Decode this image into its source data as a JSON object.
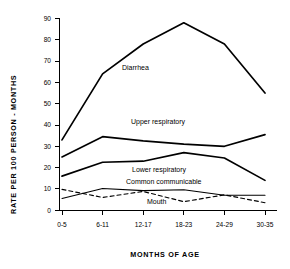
{
  "chart_data": {
    "type": "line",
    "title": "",
    "xlabel": "MONTHS OF AGE",
    "ylabel": "RATE PER 100 PERSON - MONTHS",
    "categories": [
      "0-5",
      "6-11",
      "12-17",
      "18-23",
      "24-29",
      "30-35"
    ],
    "ylim": [
      0,
      90
    ],
    "yticks": [
      0,
      10,
      20,
      30,
      40,
      50,
      60,
      70,
      80,
      90
    ],
    "grid": false,
    "legend_position": "inline-annotations",
    "series": [
      {
        "name": "Diarrhea",
        "style": "solid-thick",
        "values": [
          33,
          64,
          78,
          88,
          78,
          55
        ]
      },
      {
        "name": "Upper respiratory",
        "style": "solid-thick",
        "values": [
          25,
          34.5,
          32.5,
          31,
          30,
          35.5
        ]
      },
      {
        "name": "Lower respiratory",
        "style": "solid-thick",
        "values": [
          16,
          22.5,
          23,
          27,
          24.5,
          14
        ]
      },
      {
        "name": "Common communicable",
        "style": "solid-thin",
        "values": [
          5.5,
          10.2,
          9.2,
          9.6,
          7,
          7
        ]
      },
      {
        "name": "Mouth",
        "style": "dashed",
        "values": [
          9.8,
          6,
          8.8,
          4,
          7.2,
          3.5
        ]
      }
    ],
    "annotations": [
      {
        "text": "Diarrhea",
        "x_px": 122,
        "y_px": 70
      },
      {
        "text": "Upper respiratory",
        "x_px": 131,
        "y_px": 124
      },
      {
        "text": "Lower respiratory",
        "x_px": 132,
        "y_px": 172
      },
      {
        "text": "Common communicable",
        "x_px": 126,
        "y_px": 184
      },
      {
        "text": "Mouth",
        "x_px": 147,
        "y_px": 204
      }
    ]
  },
  "axis": {
    "y_tick_labels": [
      "0",
      "10",
      "20",
      "30",
      "40",
      "50",
      "60",
      "70",
      "80",
      "90"
    ],
    "x_tick_labels": [
      "0-5",
      "6-11",
      "12-17",
      "18-23",
      "24-29",
      "30-35"
    ],
    "y_title": "RATE PER 100 PERSON - MONTHS",
    "x_title": "MONTHS OF AGE"
  },
  "colors": {
    "ink": "#000000",
    "background": "#ffffff"
  }
}
